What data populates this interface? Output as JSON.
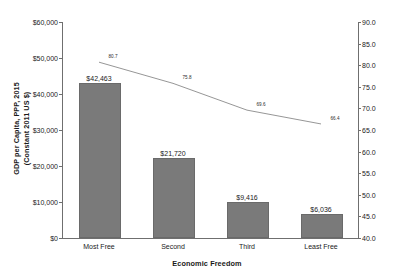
{
  "chart_data": {
    "type": "bar",
    "title": "",
    "xlabel": "Economic Freedom",
    "ylabel": "GDP per Capita, PPP, 2015 (Constant 2011 US $)",
    "y2label": "Life Expectancy at Birth, 2015",
    "categories": [
      "Most Free",
      "Second",
      "Third",
      "Least Free"
    ],
    "grid": false,
    "legend": "none",
    "ylim": [
      0,
      60000
    ],
    "y2lim": [
      40.0,
      90.0
    ],
    "yticks": [
      "$0",
      "$10,000",
      "$20,000",
      "$30,000",
      "$40,000",
      "$50,000",
      "$60,000"
    ],
    "ytick_values": [
      0,
      10000,
      20000,
      30000,
      40000,
      50000,
      60000
    ],
    "y2ticks": [
      "40.0",
      "45.0",
      "50.0",
      "55.0",
      "60.0",
      "65.0",
      "70.0",
      "75.0",
      "80.0",
      "85.0",
      "90.0"
    ],
    "y2tick_values": [
      40.0,
      45.0,
      50.0,
      55.0,
      60.0,
      65.0,
      70.0,
      75.0,
      80.0,
      85.0,
      90.0
    ],
    "series": [
      {
        "name": "GDP per Capita, PPP, 2015 (Constant 2011 US $)",
        "type": "bar",
        "axis": "left",
        "color": "#7a7a7a",
        "values": [
          42463,
          21720,
          9416,
          6036
        ],
        "labels": [
          "$42,463",
          "$21,720",
          "$9,416",
          "$6,036"
        ]
      },
      {
        "name": "Life Expectancy at Birth, 2015",
        "type": "line",
        "axis": "right",
        "color": "#8a8a8a",
        "values": [
          80.7,
          75.8,
          69.6,
          66.4
        ],
        "labels": [
          "80.7",
          "75.8",
          "69.6",
          "66.4"
        ]
      }
    ]
  },
  "axes": {
    "left_title": "GDP per Capita, PPP, 2015\n(Constant 2011 US $)",
    "left_title_line1": "GDP per Capita, PPP, 2015",
    "left_title_line2": "(Constant 2011 US $)",
    "right_title": "Life Expectancy at Birth, 2015",
    "bottom_title": "Economic Freedom"
  }
}
